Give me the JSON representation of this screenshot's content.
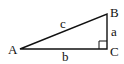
{
  "diagram": {
    "type": "right-triangle",
    "colors": {
      "stroke": "#111111",
      "background": "#ffffff",
      "text": "#111111"
    },
    "vertices": [
      {
        "id": "A",
        "label": "A",
        "x": 20,
        "y": 49
      },
      {
        "id": "B",
        "label": "B",
        "x": 107,
        "y": 14
      },
      {
        "id": "C",
        "label": "C",
        "x": 107,
        "y": 49
      }
    ],
    "sides": [
      {
        "id": "a",
        "label": "a",
        "from": "B",
        "to": "C"
      },
      {
        "id": "b",
        "label": "b",
        "from": "A",
        "to": "C"
      },
      {
        "id": "c",
        "label": "c",
        "from": "A",
        "to": "B"
      }
    ],
    "right_angle_at": "C"
  }
}
